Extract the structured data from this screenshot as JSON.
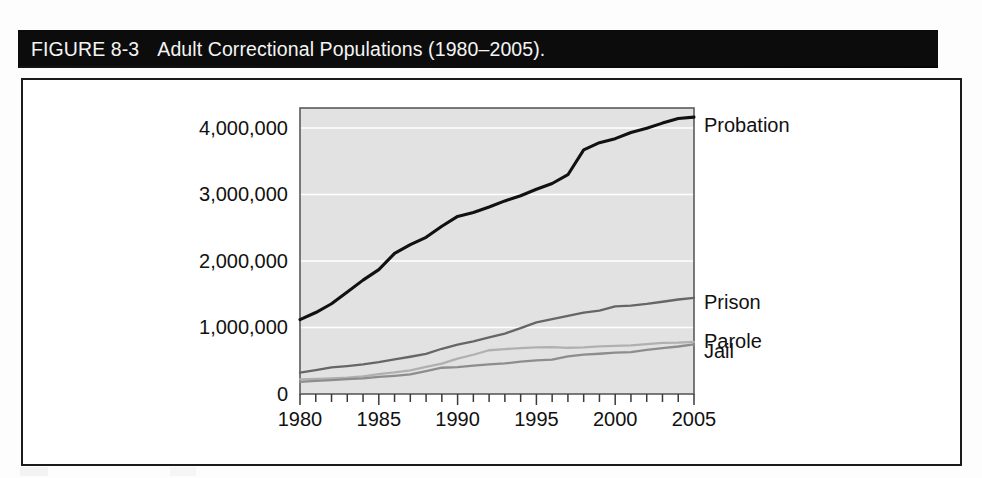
{
  "figure": {
    "label": "FIGURE 8-3",
    "caption": "Adult Correctional Populations (1980–2005)."
  },
  "colors": {
    "title_bar_bg": "#0c0c0c",
    "title_bar_text": "#f4f4f4",
    "frame_border": "#1b1b1b",
    "plot_bg": "#e2e2e2",
    "plot_border": "#5a5a5a",
    "gridline": "#ffffff",
    "axis_text": "#111111",
    "probation_line": "#111111",
    "prison_line": "#666666",
    "parole_line": "#b0b0b0",
    "jail_line": "#8d8d8d"
  },
  "chart_data": {
    "type": "line",
    "title": "Adult Correctional Populations (1980–2005).",
    "xlabel": "",
    "ylabel": "",
    "xlim": [
      1980,
      2005
    ],
    "ylim": [
      0,
      4300000
    ],
    "grid": true,
    "gridlines_y": [
      1000000,
      2000000,
      3000000,
      4000000
    ],
    "legend_position": "right-inline-labels",
    "ytick_labels": [
      "0",
      "1,000,000",
      "2,000,000",
      "3,000,000",
      "4,000,000"
    ],
    "ytick_values": [
      0,
      1000000,
      2000000,
      3000000,
      4000000
    ],
    "xtick_labels": [
      "1980",
      "1985",
      "1990",
      "1995",
      "2000",
      "2005"
    ],
    "xtick_values": [
      1980,
      1985,
      1990,
      1995,
      2000,
      2005
    ],
    "minor_xticks_every": 1,
    "x": [
      1980,
      1981,
      1982,
      1983,
      1984,
      1985,
      1986,
      1987,
      1988,
      1989,
      1990,
      1991,
      1992,
      1993,
      1994,
      1995,
      1996,
      1997,
      1998,
      1999,
      2000,
      2001,
      2002,
      2003,
      2004,
      2005
    ],
    "series": [
      {
        "name": "Probation",
        "color": "#111111",
        "width": 3.1,
        "label_y_value": 4050000,
        "values": [
          1118000,
          1225000,
          1357000,
          1532000,
          1712000,
          1870000,
          2114000,
          2247000,
          2356000,
          2522000,
          2670000,
          2729000,
          2811000,
          2903000,
          2981000,
          3078000,
          3165000,
          3297000,
          3670000,
          3779000,
          3839000,
          3932000,
          3995000,
          4073000,
          4143000,
          4163000
        ]
      },
      {
        "name": "Prison",
        "color": "#666666",
        "width": 2.3,
        "label_y_value": 1380000,
        "values": [
          320000,
          360000,
          400000,
          420000,
          445000,
          480000,
          522000,
          560000,
          603000,
          680000,
          743000,
          792000,
          851000,
          909000,
          990000,
          1078000,
          1127000,
          1176000,
          1224000,
          1254000,
          1316000,
          1330000,
          1355000,
          1387000,
          1421000,
          1446000
        ]
      },
      {
        "name": "Parole",
        "color": "#b0b0b0",
        "width": 2.3,
        "label_y_value": 790000,
        "values": [
          220000,
          226000,
          234000,
          247000,
          266000,
          300000,
          325000,
          356000,
          407000,
          456000,
          531000,
          590000,
          658000,
          676000,
          690000,
          700000,
          705000,
          695000,
          700000,
          715000,
          724000,
          732000,
          750000,
          769000,
          771000,
          784000
        ]
      },
      {
        "name": "Jail",
        "color": "#8d8d8d",
        "width": 2.3,
        "label_y_value": 650000,
        "values": [
          182000,
          196000,
          209000,
          224000,
          234000,
          256000,
          274000,
          295000,
          343000,
          395000,
          405000,
          426000,
          445000,
          459000,
          486000,
          507000,
          518000,
          567000,
          592000,
          605000,
          621000,
          631000,
          665000,
          691000,
          714000,
          747000
        ]
      }
    ]
  }
}
